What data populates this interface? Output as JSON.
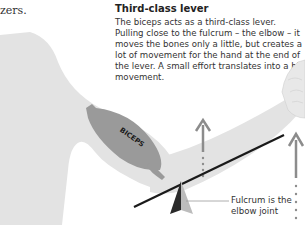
{
  "previous_text_fragment": "zers.",
  "caption": {
    "title": "Third-class lever",
    "body": "The biceps acts as a third-class lever. Pulling close to the fulcrum – the elbow – it moves the bones only a little, but creates a lot of movement for the hand at the end of the lever. A small effort translates into a big movement."
  },
  "diagram": {
    "muscle_label": "BICEPS",
    "fulcrum_label": "Fulcrum is the elbow joint",
    "colors": {
      "body": "#e3e3e3",
      "muscle": "#9a9a9a",
      "lever": "#1a1a1a",
      "arrow": "#8c8c8c",
      "fulcrum_dark": "#2a2a2a",
      "fulcrum_light": "#bcbcbc"
    }
  }
}
